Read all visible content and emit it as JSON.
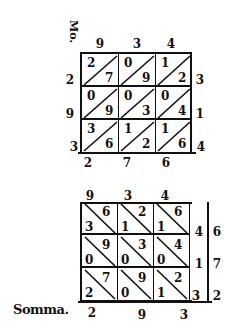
{
  "figure_a": {
    "margin_label": "Mo.",
    "top_digits": [
      "9",
      "3",
      "4"
    ],
    "left_digits": [
      "2",
      "9",
      "3"
    ],
    "right_digits": [
      "3",
      "1",
      "4"
    ],
    "bottom_digits": [
      "2",
      "7",
      "6"
    ],
    "diagonal": "bottom-left to top-right",
    "cells": [
      [
        {
          "tens": "2",
          "units": "7"
        },
        {
          "tens": "0",
          "units": "9"
        },
        {
          "tens": "1",
          "units": "2"
        }
      ],
      [
        {
          "tens": "0",
          "units": "9"
        },
        {
          "tens": "0",
          "units": "3"
        },
        {
          "tens": "0",
          "units": "4"
        }
      ],
      [
        {
          "tens": "3",
          "units": "6"
        },
        {
          "tens": "1",
          "units": "2"
        },
        {
          "tens": "1",
          "units": "6"
        }
      ]
    ]
  },
  "figure_b": {
    "top_digits": [
      "9",
      "3",
      "4"
    ],
    "right_inner_digits": [
      "4",
      "1",
      "3"
    ],
    "right_outer_digits": [
      "6",
      "7",
      "2"
    ],
    "diagonal": "top-left to bottom-right",
    "cells": [
      [
        {
          "tens": "3",
          "units": "6"
        },
        {
          "tens": "1",
          "units": "2"
        },
        {
          "tens": "1",
          "units": "6"
        }
      ],
      [
        {
          "tens": "0",
          "units": "9"
        },
        {
          "tens": "0",
          "units": "3"
        },
        {
          "tens": "0",
          "units": "4"
        }
      ],
      [
        {
          "tens": "2",
          "units": "7"
        },
        {
          "tens": "0",
          "units": "9"
        },
        {
          "tens": "1",
          "units": "2"
        }
      ]
    ],
    "sum_label": "Somma.",
    "sum_digits": [
      "2",
      "9",
      "3"
    ]
  }
}
